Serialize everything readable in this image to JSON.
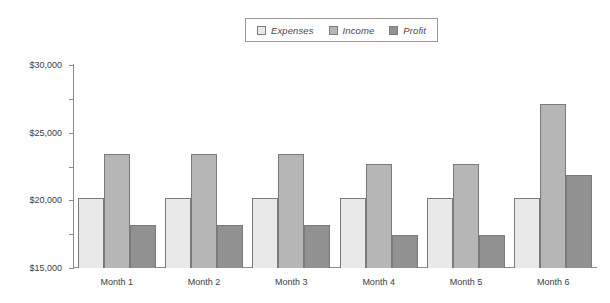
{
  "legend": {
    "entries": [
      {
        "label": "Expenses",
        "color": "#e9e9e9"
      },
      {
        "label": "Income",
        "color": "#b6b6b6"
      },
      {
        "label": "Profit",
        "color": "#919191"
      }
    ]
  },
  "axis": {
    "y_ticks": [
      "$30,000",
      "$25,000",
      "$20,000",
      "$15,000",
      "$10,000",
      "$5,000",
      "$0"
    ]
  },
  "chart_data": {
    "type": "bar",
    "title": "",
    "xlabel": "",
    "ylabel": "",
    "ylim": [
      0,
      30000
    ],
    "ytick_values": [
      0,
      5000,
      10000,
      15000,
      20000,
      25000,
      30000
    ],
    "grid": false,
    "legend_position": "top-center",
    "categories": [
      "Month 1",
      "Month 2",
      "Month 3",
      "Month 4",
      "Month 5",
      "Month 6"
    ],
    "series": [
      {
        "name": "Expenses",
        "color": "#e9e9e9",
        "values": [
          10400,
          10400,
          10400,
          10400,
          10400,
          10400
        ]
      },
      {
        "name": "Income",
        "color": "#b6b6b6",
        "values": [
          16800,
          16800,
          16800,
          15400,
          15400,
          24300
        ]
      },
      {
        "name": "Profit",
        "color": "#919191",
        "values": [
          6300,
          6300,
          6300,
          4900,
          4900,
          13800
        ]
      }
    ]
  }
}
